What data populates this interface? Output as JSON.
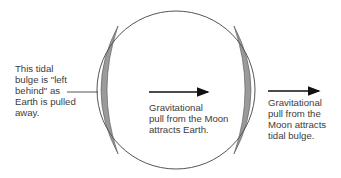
{
  "diagram": {
    "labels": {
      "left_bulge": [
        "This tidal",
        "bulge is \"left",
        "behind\" as",
        "Earth is pulled",
        "away."
      ],
      "earth_pull": [
        "Gravitational",
        "pull from the Moon",
        "attracts Earth."
      ],
      "near_bulge": [
        "Gravitational",
        "pull from the",
        "Moon attracts",
        "tidal bulge."
      ]
    },
    "arrows": [
      {
        "name": "earth-pull-arrow",
        "direction": "right"
      },
      {
        "name": "bulge-pull-arrow",
        "direction": "right"
      }
    ],
    "colors": {
      "outline": "#555555",
      "bulge_fill": "#9a9a9a",
      "text": "#3c3c3c",
      "arrow": "#111111"
    }
  }
}
